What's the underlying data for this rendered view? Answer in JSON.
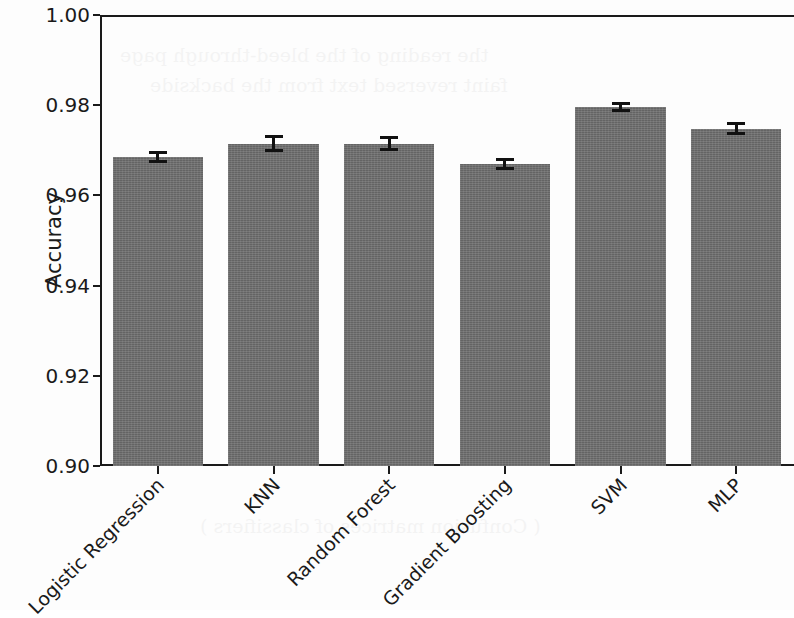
{
  "chart_data": {
    "type": "bar",
    "title": "",
    "xlabel": "",
    "ylabel": "Accuracy",
    "categories": [
      "Logistic Regression",
      "KNN",
      "Random Forest",
      "Gradient Boosting",
      "SVM",
      "MLP"
    ],
    "values": [
      0.9685,
      0.9715,
      0.9715,
      0.967,
      0.9795,
      0.9748
    ],
    "errors": [
      0.0013,
      0.0018,
      0.0017,
      0.0013,
      0.0011,
      0.0015
    ],
    "ylim": [
      0.9,
      1.0
    ],
    "yticks": [
      "0.90",
      "0.92",
      "0.94",
      "0.96",
      "0.98",
      "1.00"
    ],
    "ytick_values": [
      0.9,
      0.92,
      0.94,
      0.96,
      0.98,
      1.0
    ],
    "grid": false,
    "legend": null,
    "bar_color": "#6e6e6e",
    "error_color": "#111111",
    "axis_color": "#1a1a1a",
    "xtick_rotation": -45
  },
  "ghost_text": {
    "line1": "the reading of the bleed-through page",
    "line2": "faint reversed text from the backside",
    "line3": "( Confusion matrices of classifiers )"
  }
}
